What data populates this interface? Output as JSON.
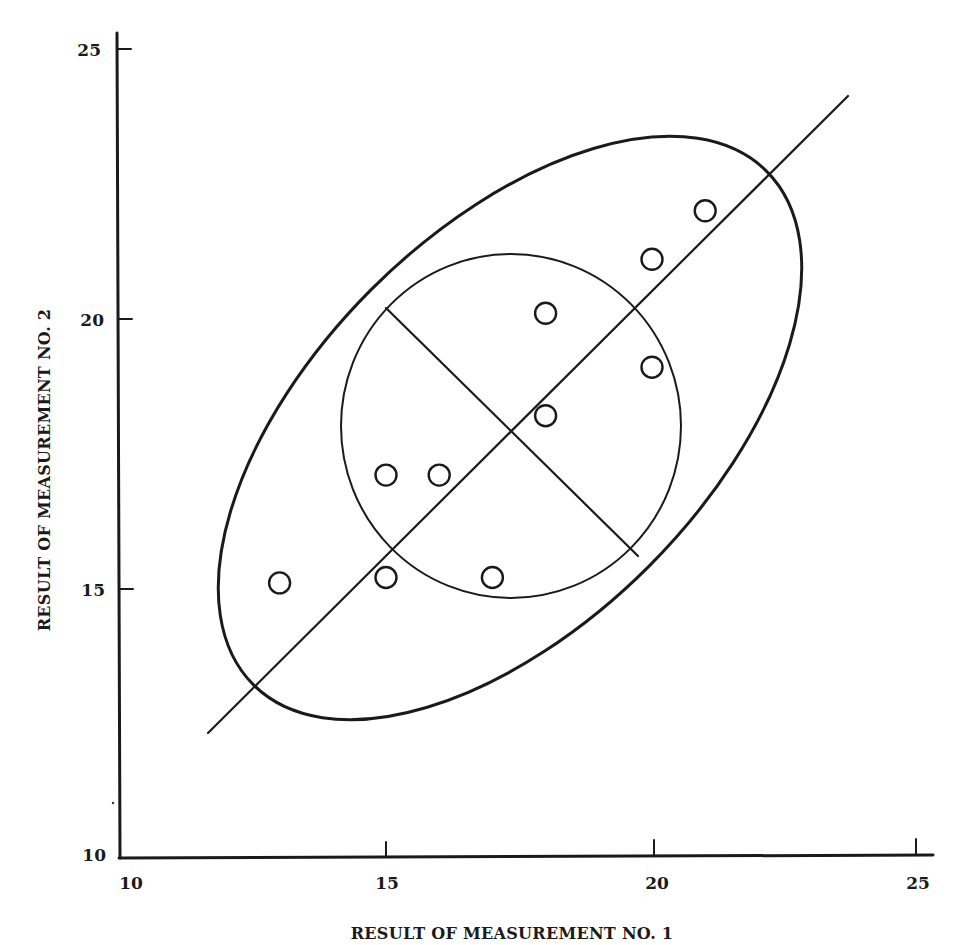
{
  "chart_data": {
    "type": "scatter",
    "title": "",
    "xlabel": "RESULT OF MEASUREMENT NO. 1",
    "ylabel": "RESULT OF MEASUREMENT NO. 2",
    "xlim": [
      10,
      25
    ],
    "ylim": [
      10,
      25
    ],
    "x_ticks": [
      10,
      15,
      20,
      25
    ],
    "y_ticks": [
      10,
      15,
      20,
      25
    ],
    "x_tick_labels": [
      "10",
      "15",
      "20",
      "25"
    ],
    "y_tick_labels": [
      "10",
      "15",
      "20",
      "25"
    ],
    "grid": false,
    "legend": null,
    "series": [
      {
        "name": "measurements",
        "marker": "open-circle",
        "points": [
          {
            "x": 13,
            "y": 15.1
          },
          {
            "x": 15,
            "y": 17.1
          },
          {
            "x": 15,
            "y": 15.2
          },
          {
            "x": 16,
            "y": 17.1
          },
          {
            "x": 17,
            "y": 15.2
          },
          {
            "x": 18,
            "y": 20.1
          },
          {
            "x": 18,
            "y": 18.2
          },
          {
            "x": 20,
            "y": 21.1
          },
          {
            "x": 20,
            "y": 19.1
          },
          {
            "x": 21,
            "y": 22.0
          }
        ]
      }
    ],
    "annotations": [
      {
        "type": "line",
        "name": "major-axis-diagonal",
        "from": {
          "x": 11.6,
          "y": 12.3
        },
        "to": {
          "x": 23.6,
          "y": 24.1
        }
      },
      {
        "type": "line",
        "name": "minor-axis-perpendicular",
        "from": {
          "x": 15.0,
          "y": 20.2
        },
        "to": {
          "x": 19.7,
          "y": 15.6
        }
      },
      {
        "type": "ellipse",
        "name": "inner-circle",
        "center": {
          "x": 17.4,
          "y": 18.0
        },
        "radius_x": 3.2,
        "radius_y": 3.2
      },
      {
        "type": "ellipse",
        "name": "outer-ellipse",
        "center": {
          "x": 17.4,
          "y": 17.9
        },
        "rotation_deg": -45,
        "semi_major": 6.9,
        "semi_minor": 3.7
      }
    ]
  },
  "axes": {
    "x_title": "RESULT OF MEASUREMENT NO. 1",
    "y_title": "RESULT OF MEASUREMENT NO. 2",
    "x_tick_labels": [
      "10",
      "15",
      "20",
      "25"
    ],
    "y_tick_labels": [
      "10",
      "15",
      "20",
      "25"
    ]
  }
}
